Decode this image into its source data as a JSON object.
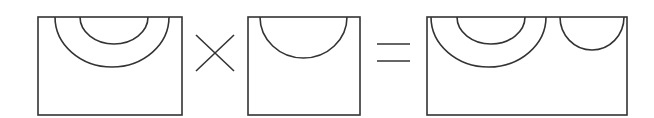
{
  "diagram": {
    "stroke_color": "#333333",
    "background": "#ffffff",
    "operators": {
      "multiply": "×",
      "equals": "="
    },
    "terms": [
      {
        "name": "left-operand",
        "arcs": 2
      },
      {
        "name": "right-operand",
        "arcs": 1
      },
      {
        "name": "result",
        "arcs": 3
      }
    ]
  }
}
